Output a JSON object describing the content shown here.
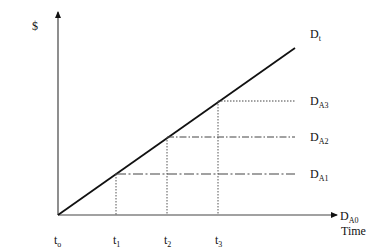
{
  "diagram": {
    "y_axis_label": "$",
    "x_axis_label": "Time",
    "lines": {
      "total": {
        "main": "D",
        "sub": "t"
      },
      "a3": {
        "main": "D",
        "sub": "A3"
      },
      "a2": {
        "main": "D",
        "sub": "A2"
      },
      "a1": {
        "main": "D",
        "sub": "A1"
      },
      "a0": {
        "main": "D",
        "sub": "A0"
      }
    },
    "ticks": [
      {
        "main": "t",
        "sub": "o"
      },
      {
        "main": "t",
        "sub": "1"
      },
      {
        "main": "t",
        "sub": "2"
      },
      {
        "main": "t",
        "sub": "3"
      }
    ],
    "colors": {
      "line": "#111111",
      "axis": "#444444",
      "guide": "#555555"
    }
  }
}
